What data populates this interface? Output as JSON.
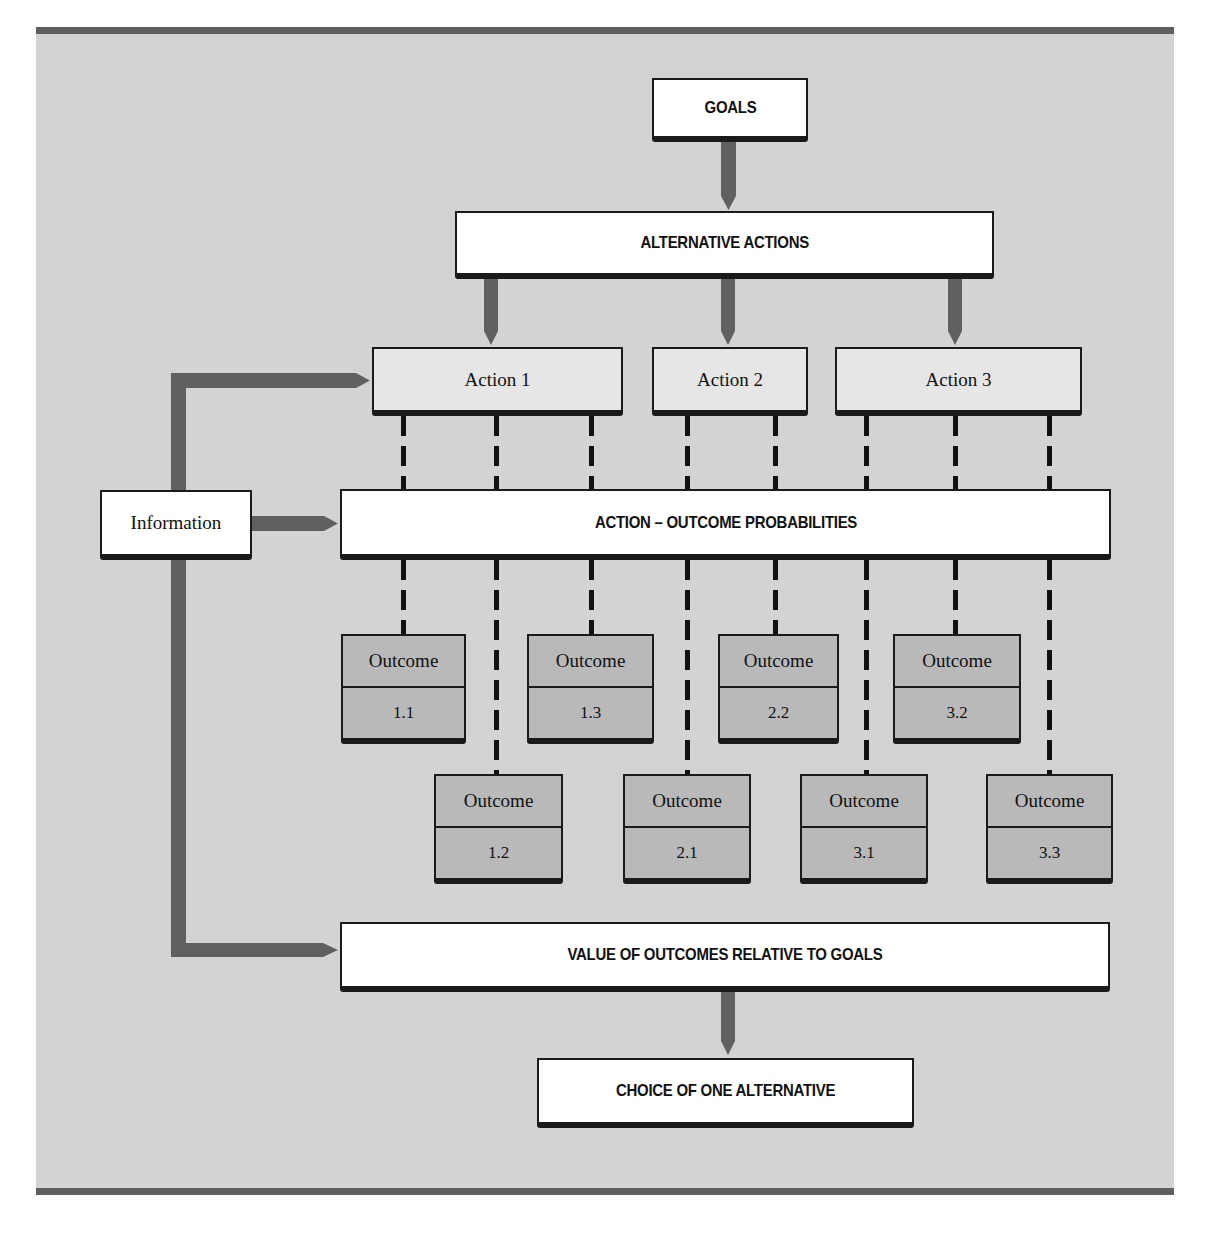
{
  "diagram": {
    "type": "decision-making flowchart",
    "colors": {
      "background": "#d3d3d3",
      "rule": "#5e5e5e",
      "arrow": "#606060",
      "box_white": "#ffffff",
      "box_action": "#e6e6e6",
      "box_outcome": "#b9b9b9",
      "line": "#111111"
    },
    "goals": "GOALS",
    "alternative_actions": "ALTERNATIVE ACTIONS",
    "actions": [
      {
        "label": "Action 1"
      },
      {
        "label": "Action 2"
      },
      {
        "label": "Action 3"
      }
    ],
    "information": "Information",
    "probabilities": "ACTION – OUTCOME PROBABILITIES",
    "outcomes": [
      {
        "title": "Outcome",
        "id": "1.1"
      },
      {
        "title": "Outcome",
        "id": "1.2"
      },
      {
        "title": "Outcome",
        "id": "1.3"
      },
      {
        "title": "Outcome",
        "id": "2.1"
      },
      {
        "title": "Outcome",
        "id": "2.2"
      },
      {
        "title": "Outcome",
        "id": "3.1"
      },
      {
        "title": "Outcome",
        "id": "3.2"
      },
      {
        "title": "Outcome",
        "id": "3.3"
      }
    ],
    "value": "VALUE OF OUTCOMES RELATIVE TO GOALS",
    "choice": "CHOICE OF ONE ALTERNATIVE"
  }
}
